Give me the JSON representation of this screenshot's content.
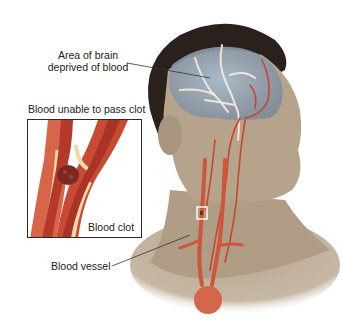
{
  "diagram": {
    "type": "medical-illustration",
    "labels": {
      "brain_area": [
        "Area of brain",
        "deprived of blood"
      ],
      "inset_title": "Blood unable to pass clot",
      "clot": "Blood clot",
      "vessel": "Blood vessel"
    },
    "colors": {
      "skin": "#b8a58e",
      "hair": "#2b211c",
      "brain": "#9fb3c6",
      "artery": "#c8472e",
      "vessel_wall": "#f2d9a8",
      "clot": "#7a2a22",
      "marker_box": "#ffffff",
      "leader_line": "#333333"
    }
  }
}
